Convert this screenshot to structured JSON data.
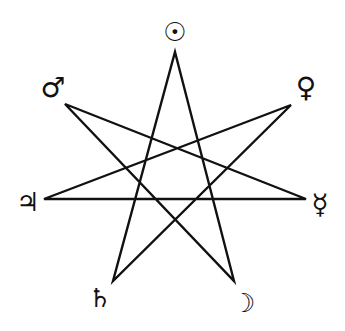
{
  "diagram": {
    "title": "",
    "type": "heptagram",
    "stroke_color": "#111111",
    "background": "#ffffff",
    "path_order": [
      0,
      3,
      6,
      2,
      5,
      1,
      4,
      0
    ],
    "vertices": [
      {
        "id": 0,
        "name": "sun",
        "x": 175,
        "y": 52
      },
      {
        "id": 1,
        "name": "venus",
        "x": 291,
        "y": 105
      },
      {
        "id": 2,
        "name": "mercury",
        "x": 306,
        "y": 199
      },
      {
        "id": 3,
        "name": "moon",
        "x": 234,
        "y": 281
      },
      {
        "id": 4,
        "name": "saturn",
        "x": 113,
        "y": 281
      },
      {
        "id": 5,
        "name": "jupiter",
        "x": 44,
        "y": 199
      },
      {
        "id": 6,
        "name": "mars",
        "x": 65,
        "y": 104
      }
    ],
    "labels": [
      {
        "name": "sun",
        "glyph": "☉",
        "x": 175,
        "y": 32,
        "size": 26
      },
      {
        "name": "venus",
        "glyph": "♀",
        "x": 306,
        "y": 88,
        "size": 28
      },
      {
        "name": "mercury",
        "glyph": "☿",
        "x": 320,
        "y": 205,
        "size": 28
      },
      {
        "name": "moon",
        "glyph": "☽",
        "x": 244,
        "y": 303,
        "size": 26
      },
      {
        "name": "saturn",
        "glyph": "♄",
        "x": 100,
        "y": 298,
        "size": 26
      },
      {
        "name": "jupiter",
        "glyph": "♃",
        "x": 28,
        "y": 202,
        "size": 26
      },
      {
        "name": "mars",
        "glyph": "♂",
        "x": 53,
        "y": 88,
        "size": 28
      }
    ]
  }
}
